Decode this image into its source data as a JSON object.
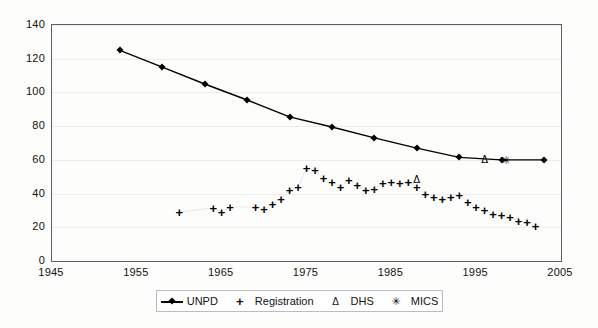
{
  "chart_data": {
    "type": "line",
    "title": "",
    "xlabel": "",
    "ylabel": "",
    "xlim": [
      1945,
      2005
    ],
    "ylim": [
      0,
      140
    ],
    "xticks": [
      1945,
      1955,
      1965,
      1975,
      1985,
      1995,
      2005
    ],
    "yticks": [
      0,
      20,
      40,
      60,
      80,
      100,
      120,
      140
    ],
    "grid": "horizontal",
    "legend_position": "bottom",
    "series": [
      {
        "name": "UNPD",
        "marker": "diamond",
        "line": true,
        "points": [
          {
            "x": 1953,
            "y": 125
          },
          {
            "x": 1958,
            "y": 115
          },
          {
            "x": 1963,
            "y": 105
          },
          {
            "x": 1968,
            "y": 95.5
          },
          {
            "x": 1973,
            "y": 85.5
          },
          {
            "x": 1978,
            "y": 79.5
          },
          {
            "x": 1983,
            "y": 73
          },
          {
            "x": 1988,
            "y": 67
          },
          {
            "x": 1993,
            "y": 61.5
          },
          {
            "x": 1998,
            "y": 60
          },
          {
            "x": 2003,
            "y": 60
          }
        ]
      },
      {
        "name": "Registration",
        "marker": "plus",
        "line": false,
        "points": [
          {
            "x": 1960,
            "y": 29
          },
          {
            "x": 1964,
            "y": 31.5
          },
          {
            "x": 1965,
            "y": 29
          },
          {
            "x": 1966,
            "y": 32
          },
          {
            "x": 1969,
            "y": 32
          },
          {
            "x": 1970,
            "y": 31
          },
          {
            "x": 1971,
            "y": 34
          },
          {
            "x": 1972,
            "y": 37
          },
          {
            "x": 1973,
            "y": 42
          },
          {
            "x": 1974,
            "y": 44
          },
          {
            "x": 1975,
            "y": 55
          },
          {
            "x": 1976,
            "y": 54
          },
          {
            "x": 1977,
            "y": 49
          },
          {
            "x": 1978,
            "y": 47
          },
          {
            "x": 1979,
            "y": 44
          },
          {
            "x": 1980,
            "y": 48
          },
          {
            "x": 1981,
            "y": 45
          },
          {
            "x": 1982,
            "y": 42
          },
          {
            "x": 1983,
            "y": 43
          },
          {
            "x": 1984,
            "y": 46
          },
          {
            "x": 1985,
            "y": 47
          },
          {
            "x": 1986,
            "y": 46
          },
          {
            "x": 1987,
            "y": 47
          },
          {
            "x": 1988,
            "y": 44
          },
          {
            "x": 1989,
            "y": 40
          },
          {
            "x": 1990,
            "y": 38
          },
          {
            "x": 1991,
            "y": 37
          },
          {
            "x": 1992,
            "y": 38
          },
          {
            "x": 1993,
            "y": 39
          },
          {
            "x": 1994,
            "y": 35
          },
          {
            "x": 1995,
            "y": 32
          },
          {
            "x": 1996,
            "y": 30
          },
          {
            "x": 1997,
            "y": 28
          },
          {
            "x": 1998,
            "y": 27
          },
          {
            "x": 1999,
            "y": 26
          },
          {
            "x": 2000,
            "y": 24
          },
          {
            "x": 2001,
            "y": 23
          },
          {
            "x": 2002,
            "y": 21
          }
        ]
      },
      {
        "name": "DHS",
        "marker": "triangle",
        "line": false,
        "points": [
          {
            "x": 1988,
            "y": 48
          },
          {
            "x": 1996,
            "y": 60
          }
        ]
      },
      {
        "name": "MICS",
        "marker": "star",
        "line": false,
        "points": [
          {
            "x": 1998.5,
            "y": 60
          }
        ]
      }
    ]
  },
  "legend": {
    "items": [
      {
        "label": "UNPD",
        "symbol": "line-diamond"
      },
      {
        "label": "Registration",
        "symbol": "plus"
      },
      {
        "label": "DHS",
        "symbol": "triangle"
      },
      {
        "label": "MICS",
        "symbol": "star"
      }
    ]
  },
  "glyphs": {
    "plus": "+",
    "triangle": "Δ",
    "star": "✳"
  }
}
